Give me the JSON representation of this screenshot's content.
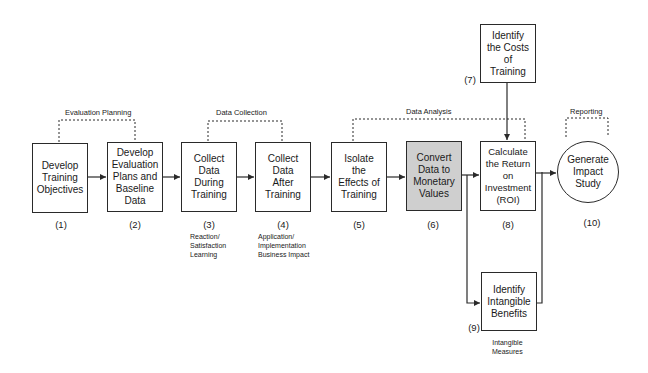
{
  "diagram": {
    "phases": [
      {
        "id": "evaluation_planning",
        "label": "Evaluation Planning"
      },
      {
        "id": "data_collection",
        "label": "Data Collection"
      },
      {
        "id": "data_analysis",
        "label": "Data Analysis"
      },
      {
        "id": "reporting",
        "label": "Reporting"
      }
    ],
    "steps": [
      {
        "num": "(1)",
        "label": "Develop\nTraining\nObjectives"
      },
      {
        "num": "(2)",
        "label": "Develop\nEvaluation\nPlans and\nBaseline\nData"
      },
      {
        "num": "(3)",
        "label": "Collect\nData\nDuring\nTraining"
      },
      {
        "num": "(4)",
        "label": "Collect\nData\nAfter\nTraining"
      },
      {
        "num": "(5)",
        "label": "Isolate\nthe\nEffects of\nTraining"
      },
      {
        "num": "(6)",
        "label": "Convert\nData to\nMonetary\nValues"
      },
      {
        "num": "(7)",
        "label": "Identify\nthe Costs\nof\nTraining"
      },
      {
        "num": "(8)",
        "label": "Calculate\nthe Return on\nInvestment\n(ROI)"
      },
      {
        "num": "(9)",
        "label": "Identify\nIntangible\nBenefits"
      },
      {
        "num": "(10)",
        "label": "Generate\nImpact\nStudy"
      }
    ],
    "notes": {
      "step3": "Reaction/\nSatisfaction\nLearning",
      "step4": "Application/\nImplementation\nBusiness Impact",
      "step9": "Intangible\nMeasures"
    },
    "colors": {
      "stroke": "#2a2a2a",
      "highlight_fill": "#cfcfcf"
    }
  }
}
